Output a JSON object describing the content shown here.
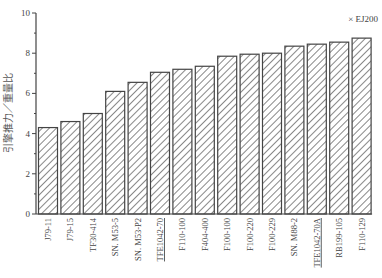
{
  "chart_data": {
    "type": "bar",
    "title": "",
    "xlabel": "",
    "ylabel": "引擎推力／重量比",
    "annotation": "× EJ200",
    "ylim": [
      0,
      10
    ],
    "yticks": [
      0,
      2,
      4,
      6,
      8,
      10
    ],
    "grid": false,
    "legend": null,
    "pattern": "diagonal-hatch",
    "categories": [
      "J79-11",
      "J79-15",
      "TF30-414",
      "SN. M53-5",
      "SN. M53-P2",
      "TFE1042-70",
      "F110-100",
      "F404-400",
      "F100-100",
      "F100-220",
      "F100-229",
      "SN. M88-2",
      "TFE1042-70A",
      "RB199-105",
      "F110-129"
    ],
    "underlined": [
      "TFE1042-70",
      "TFE1042-70A"
    ],
    "values": [
      4.3,
      4.6,
      5.0,
      6.1,
      6.55,
      7.05,
      7.2,
      7.35,
      7.85,
      7.95,
      8.0,
      8.35,
      8.45,
      8.55,
      8.75
    ]
  }
}
